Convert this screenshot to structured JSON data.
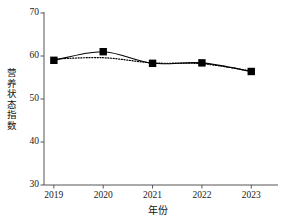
{
  "chart_data": {
    "type": "line",
    "title": "",
    "xlabel": "年份",
    "ylabel": "营养状态指数",
    "categories": [
      "2019",
      "2020",
      "2021",
      "2022",
      "2023"
    ],
    "x": [
      2019,
      2020,
      2021,
      2022,
      2023
    ],
    "xlim": [
      2018.8,
      2023.4
    ],
    "ylim": [
      30,
      70
    ],
    "yticks": [
      30,
      40,
      50,
      60,
      70
    ],
    "ytick_labels": [
      "30",
      "40",
      "50",
      "60",
      "70"
    ],
    "xticks": [
      2019,
      2020,
      2021,
      2022,
      2023
    ],
    "xtick_labels": [
      "2019",
      "2020",
      "2021",
      "2022",
      "2023"
    ],
    "grid": false,
    "legend": false,
    "legend_position": "none",
    "series": [
      {
        "name": "营养状态指数",
        "style": "solid",
        "marker": "square",
        "marker_color": "#000000",
        "line_color": "#000000",
        "values": [
          59.0,
          61.0,
          58.3,
          58.4,
          56.4
        ]
      },
      {
        "name": "趋势线",
        "style": "dotted",
        "marker": "none",
        "line_color": "#000000",
        "values": [
          59.3,
          59.6,
          58.4,
          58.2,
          56.5
        ]
      }
    ],
    "axis_spines": [
      "left",
      "bottom"
    ],
    "tick_direction": "out",
    "background_color": "#ffffff",
    "foreground_color": "#000000"
  },
  "geometry": {
    "plot_left": 44,
    "plot_right": 271,
    "plot_top": 13,
    "plot_bottom": 185
  }
}
